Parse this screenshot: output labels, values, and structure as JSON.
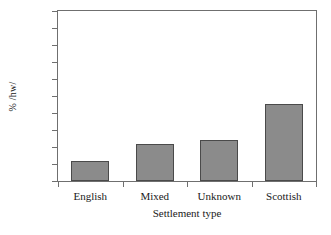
{
  "chart_data": {
    "type": "bar",
    "title": "",
    "xlabel": "Settlement type",
    "ylabel": "% /hw/",
    "categories": [
      "English",
      "Mixed",
      "Unknown",
      "Scottish"
    ],
    "values": [
      12,
      22,
      24,
      45.5
    ],
    "ylim": [
      0,
      100
    ],
    "yticks": [
      0,
      10,
      20,
      30,
      40,
      50,
      60,
      70,
      80,
      90,
      100
    ],
    "ytick_labels": [
      "0",
      "10",
      "20",
      "30",
      "40",
      "50",
      "60",
      "70",
      "80",
      "90",
      "100"
    ],
    "grid": false,
    "legend": false,
    "bar_color": "#8b8b8b",
    "bar_edge_color": "#4a4a4a",
    "axis_color": "#6f6f6f",
    "background_color": "#ffffff"
  }
}
